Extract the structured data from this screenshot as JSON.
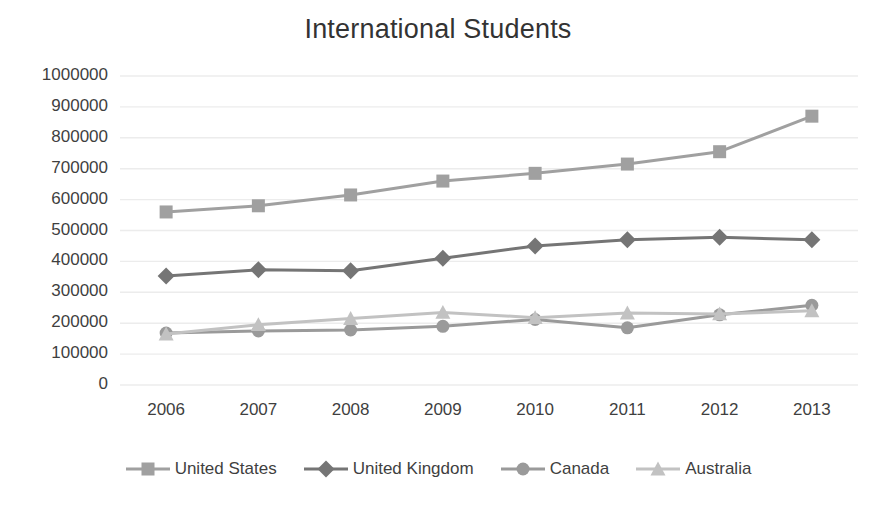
{
  "chart_data": {
    "type": "line",
    "title": "International Students",
    "xlabel": "",
    "ylabel": "",
    "x": [
      2006,
      2007,
      2008,
      2009,
      2010,
      2011,
      2012,
      2013
    ],
    "categories": [
      "2006",
      "2007",
      "2008",
      "2009",
      "2010",
      "2011",
      "2012",
      "2013"
    ],
    "ylim": [
      0,
      1000000
    ],
    "yticks": [
      0,
      100000,
      200000,
      300000,
      400000,
      500000,
      600000,
      700000,
      800000,
      900000,
      1000000
    ],
    "ytick_labels": [
      "0",
      "100000",
      "200000",
      "300000",
      "400000",
      "500000",
      "600000",
      "700000",
      "800000",
      "900000",
      "1000000"
    ],
    "grid": true,
    "legend_position": "bottom",
    "series": [
      {
        "name": "United States",
        "marker": "square",
        "color": "#a0a0a0",
        "values": [
          560000,
          580000,
          615000,
          660000,
          685000,
          715000,
          755000,
          870000
        ]
      },
      {
        "name": "United Kingdom",
        "marker": "diamond",
        "color": "#757575",
        "values": [
          353000,
          373000,
          370000,
          410000,
          450000,
          470000,
          478000,
          470000
        ]
      },
      {
        "name": "Canada",
        "marker": "circle",
        "color": "#9a9a9a",
        "values": [
          168000,
          175000,
          178000,
          190000,
          212000,
          185000,
          227000,
          258000
        ]
      },
      {
        "name": "Australia",
        "marker": "triangle",
        "color": "#c2c2c2",
        "values": [
          165000,
          195000,
          215000,
          235000,
          218000,
          233000,
          230000,
          240000
        ]
      }
    ]
  },
  "axes": {
    "grid_color": "#ececec",
    "text_color": "#3f3f3f"
  },
  "legend": {
    "items": [
      {
        "label": "United States",
        "marker": "square-marker-icon"
      },
      {
        "label": "United Kingdom",
        "marker": "diamond-marker-icon"
      },
      {
        "label": "Canada",
        "marker": "circle-marker-icon"
      },
      {
        "label": "Australia",
        "marker": "triangle-marker-icon"
      }
    ]
  }
}
